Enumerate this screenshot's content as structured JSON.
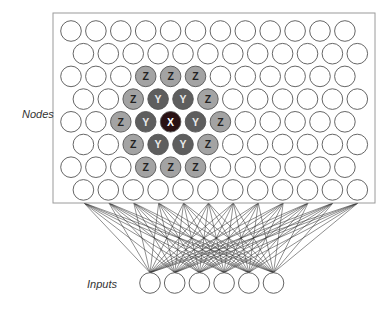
{
  "labels": {
    "nodes": "Nodes",
    "inputs": "Inputs"
  },
  "colors": {
    "empty_fill": "#ffffff",
    "stroke": "#555555",
    "z_fill": "#a3a3a3",
    "y_fill": "#5e5e5e",
    "x_fill": "#2a1214",
    "z_text": "#222222",
    "y_text": "#e8e8e8",
    "x_text": "#ffffff",
    "box_stroke": "#9a9a9a",
    "wire": "#333333"
  },
  "grid": {
    "rows": 8,
    "cols": 12,
    "highlights": [
      {
        "row": 2,
        "col": 3,
        "label": "Z"
      },
      {
        "row": 2,
        "col": 4,
        "label": "Z"
      },
      {
        "row": 2,
        "col": 5,
        "label": "Z"
      },
      {
        "row": 3,
        "col": 2,
        "label": "Z"
      },
      {
        "row": 3,
        "col": 3,
        "label": "Y"
      },
      {
        "row": 3,
        "col": 4,
        "label": "Y"
      },
      {
        "row": 3,
        "col": 5,
        "label": "Z"
      },
      {
        "row": 4,
        "col": 2,
        "label": "Z"
      },
      {
        "row": 4,
        "col": 3,
        "label": "Y"
      },
      {
        "row": 4,
        "col": 4,
        "label": "X"
      },
      {
        "row": 4,
        "col": 5,
        "label": "Y"
      },
      {
        "row": 4,
        "col": 6,
        "label": "Z"
      },
      {
        "row": 5,
        "col": 2,
        "label": "Z"
      },
      {
        "row": 5,
        "col": 3,
        "label": "Y"
      },
      {
        "row": 5,
        "col": 4,
        "label": "Y"
      },
      {
        "row": 5,
        "col": 5,
        "label": "Z"
      },
      {
        "row": 6,
        "col": 3,
        "label": "Z"
      },
      {
        "row": 6,
        "col": 4,
        "label": "Z"
      },
      {
        "row": 6,
        "col": 5,
        "label": "Z"
      }
    ]
  },
  "inputs": {
    "count": 6
  },
  "wiring": {
    "box_anchor_count": 12
  }
}
